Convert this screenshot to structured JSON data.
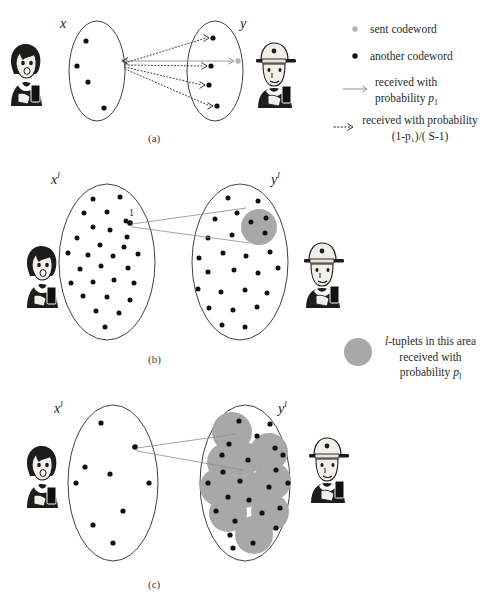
{
  "figure": {
    "caption_a": "(a)",
    "caption_b": "(b)",
    "caption_c": "(c)"
  },
  "panel_a": {
    "input_set_label": "x",
    "output_set_label": "y",
    "sender_icon": "woman-with-phone-icon",
    "receiver_icon": "man-with-cap-and-phone-icon",
    "sent_codeword_count": 1,
    "other_codeword_count": 4,
    "received_dot_count": 4
  },
  "panel_b": {
    "input_set_label": "x",
    "input_set_superscript": "l",
    "output_set_label": "y",
    "output_set_superscript": "l",
    "selected_point_label": "1",
    "gray_region_count": 1,
    "sender_icon": "woman-with-phone-icon",
    "receiver_icon": "man-with-cap-and-phone-icon"
  },
  "panel_c": {
    "input_set_label": "x",
    "input_set_superscript": "l",
    "output_set_label": "y",
    "output_set_superscript": "l",
    "gray_region_count": 10,
    "sender_icon": "woman-with-phone-icon",
    "receiver_icon": "man-with-cap-and-phone-icon"
  },
  "legend": {
    "items": [
      {
        "marker": "gray-dot-marker",
        "label": "sent codeword"
      },
      {
        "marker": "black-dot-marker",
        "label": "another codeword"
      },
      {
        "marker": "solid-arrow-marker",
        "label_line1": "received  with",
        "label_line2_prefix": "probability ",
        "label_line2_symbol": "p",
        "label_line2_subscript": "1"
      },
      {
        "marker": "dotted-arrow-marker",
        "label_line1": "received  with probability",
        "label_line2": "(1-p₁)/( S-1)"
      }
    ]
  },
  "note": {
    "marker": "gray-blob-marker",
    "line1_prefix": "l",
    "line1_rest": "-tuplets in this area",
    "line2": "received  with",
    "line3_prefix": "probability ",
    "line3_symbol": "p",
    "line3_subscript": "l"
  },
  "colors": {
    "ink": "#1a1a1a",
    "outline": "#2b2b2b",
    "gray_blob": "#a8a8a8",
    "gray_marker": "#b3b3b3",
    "solid_arrow": "#9a9a9a",
    "thin_line": "#8d8d8d",
    "background": "#ffffff"
  }
}
